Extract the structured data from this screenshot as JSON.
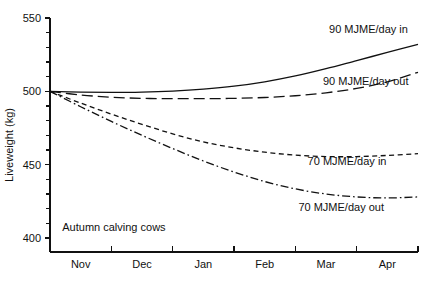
{
  "chart_data": {
    "type": "line",
    "title": "",
    "xlabel": "",
    "ylabel": "Liveweight (kg)",
    "ylim": [
      400,
      550
    ],
    "xlim": [
      0,
      6
    ],
    "grid": false,
    "legend_position": "inline-right",
    "y_ticks_major": [
      400,
      450,
      500,
      550
    ],
    "y_ticks_minor": [
      410,
      420,
      430,
      440,
      460,
      470,
      480,
      490,
      510,
      520,
      530,
      540
    ],
    "x_tick_labels": [
      "Nov",
      "Dec",
      "Jan",
      "Feb",
      "Mar",
      "Apr"
    ],
    "x_tick_positions": [
      0,
      1,
      2,
      3,
      4,
      5,
      6
    ],
    "annotations": [
      "Autumn calving cows"
    ],
    "x": [
      0,
      0.5,
      1,
      1.5,
      2,
      2.5,
      3,
      3.5,
      4,
      4.5,
      5,
      5.5,
      6
    ],
    "series": [
      {
        "name": "90 MJME/day in",
        "style": "solid",
        "label": "90 MJME/day in",
        "values": [
          500,
          499.5,
          499.3,
          499.5,
          500.2,
          501.5,
          503.5,
          506.5,
          510.5,
          515.5,
          521,
          526.5,
          532
        ]
      },
      {
        "name": "90 MJME/day out",
        "style": "long-dash",
        "label": "90 MJME/day out",
        "values": [
          500,
          497.5,
          496,
          495.2,
          495,
          495,
          495.2,
          495.8,
          497,
          499,
          502,
          506.5,
          513
        ]
      },
      {
        "name": "70 MJME/day in",
        "style": "short-dash",
        "label": "70 MJME/day in",
        "values": [
          500,
          492,
          484.5,
          477.5,
          471,
          465.5,
          461.5,
          458.5,
          456.5,
          455.5,
          455.5,
          456.3,
          457.5
        ]
      },
      {
        "name": "70 MJME/day out",
        "style": "dash-dot",
        "label": "70 MJME/day out",
        "values": [
          500,
          489.5,
          479.5,
          470,
          461,
          452.5,
          445,
          438.5,
          433.5,
          430,
          428,
          427.3,
          428
        ]
      }
    ],
    "series_label_positions": [
      {
        "x": 4.55,
        "y": 540,
        "anchor": "start"
      },
      {
        "x": 4.45,
        "y": 504.5,
        "anchor": "start"
      },
      {
        "x": 4.2,
        "y": 449.5,
        "anchor": "start"
      },
      {
        "x": 4.05,
        "y": 418.5,
        "anchor": "start"
      }
    ],
    "annotation_position": {
      "x": 0.2,
      "y": 405
    }
  },
  "figure": {
    "background_color": "#ffffff",
    "line_color": "#111111"
  }
}
